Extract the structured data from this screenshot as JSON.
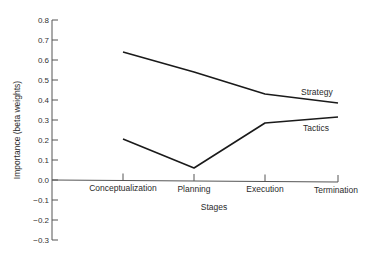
{
  "chart_data": {
    "type": "line",
    "title": "",
    "xlabel": "Stages",
    "ylabel": "Importance (beta weights)",
    "categories": [
      "Conceptualization",
      "Planning",
      "Execution",
      "Termination"
    ],
    "series": [
      {
        "name": "Strategy",
        "values": [
          0.64,
          0.54,
          0.43,
          0.385
        ]
      },
      {
        "name": "Tactics",
        "values": [
          0.205,
          0.06,
          0.285,
          0.315
        ]
      }
    ],
    "ylim": [
      -0.3,
      0.8
    ],
    "yticks": [
      "0.8",
      "0.7",
      "0.6",
      "0.5",
      "0.4",
      "0.3",
      "0.2",
      "0.1",
      "0.0",
      "−0.1",
      "−0.2",
      "−0.3"
    ],
    "grid": false,
    "legend": "inline labels near line ends"
  }
}
